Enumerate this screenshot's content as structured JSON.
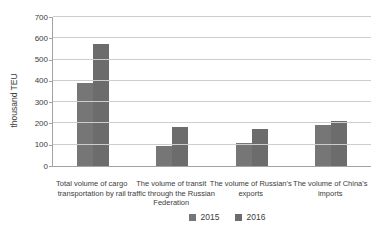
{
  "chart_data": {
    "type": "bar",
    "title": "",
    "xlabel": "",
    "ylabel": "thousand TEU",
    "ylim": [
      0,
      700
    ],
    "ytick_step": 100,
    "grid": true,
    "legend_position": "bottom",
    "categories": [
      "Total volume of cargo transportation by rail",
      "The volume of transit traffic through the Russian Federation",
      "The volume of Russian's exports",
      "The volume of China's imports"
    ],
    "series": [
      {
        "name": "2015",
        "values": [
          390,
          95,
          110,
          195
        ],
        "color": "#767676"
      },
      {
        "name": "2016",
        "values": [
          575,
          185,
          175,
          210
        ],
        "color": "#6c6c6c"
      }
    ],
    "colors": {
      "gridline": "#cdcdcd",
      "axis": "#a3a3a3",
      "text": "#3c3c3c",
      "background": "#ffffff"
    }
  }
}
